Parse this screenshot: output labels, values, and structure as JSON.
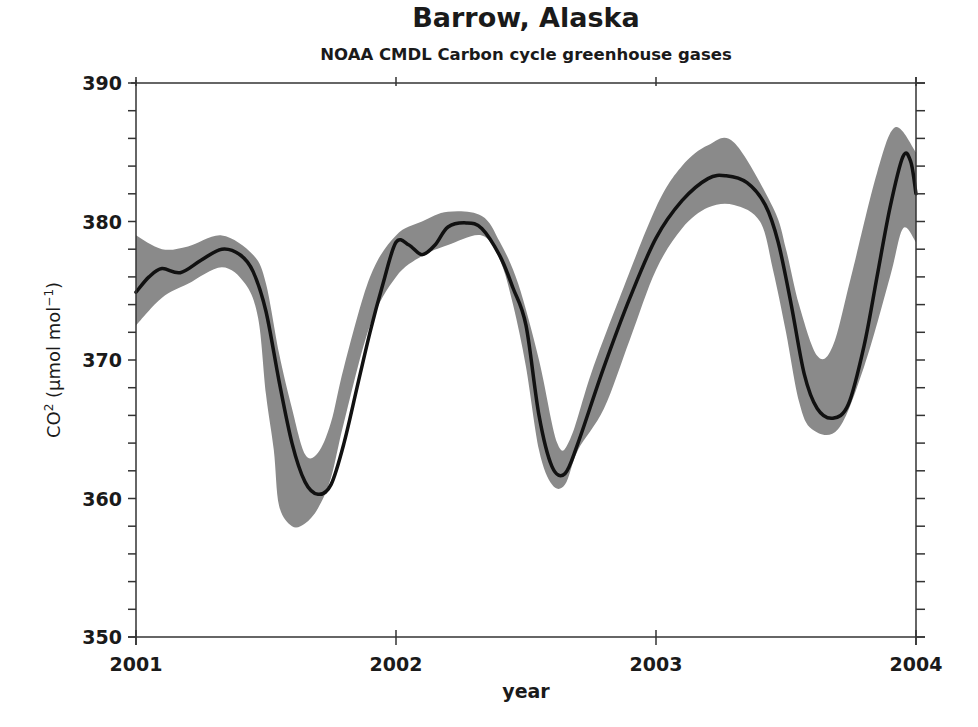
{
  "chart_data": {
    "type": "line",
    "title": "Barrow, Alaska",
    "subtitle": "NOAA CMDL Carbon cycle greenhouse gases",
    "xlabel": "year",
    "ylabel": "CO2 (µmol mol-1)",
    "ylabel_parts": {
      "main": "CO",
      "sup": "2",
      "unit_open": " (µmol mol",
      "unit_sup": "−1",
      "unit_close": ")"
    },
    "xlim": [
      2001,
      2004
    ],
    "ylim": [
      350,
      390
    ],
    "x_ticks": [
      2001,
      2002,
      2003,
      2004
    ],
    "x_tick_labels": [
      "2001",
      "2002",
      "2003",
      "2004"
    ],
    "y_ticks": [
      350,
      360,
      370,
      380,
      390
    ],
    "y_tick_labels": [
      "350",
      "360",
      "370",
      "380",
      "390"
    ],
    "y_minor_step": 2,
    "grid": false,
    "legend": null,
    "colors": {
      "line": "#111111",
      "band": "#8a8a8a",
      "axis": "#333333"
    },
    "series": [
      {
        "name": "CO2 mean",
        "x": [
          2001.0,
          2001.05,
          2001.1,
          2001.17,
          2001.25,
          2001.33,
          2001.4,
          2001.45,
          2001.5,
          2001.55,
          2001.6,
          2001.65,
          2001.7,
          2001.75,
          2001.8,
          2001.85,
          2001.9,
          2001.95,
          2002.0,
          2002.05,
          2002.1,
          2002.15,
          2002.2,
          2002.27,
          2002.33,
          2002.4,
          2002.45,
          2002.5,
          2002.55,
          2002.6,
          2002.65,
          2002.7,
          2002.8,
          2002.9,
          2003.0,
          2003.1,
          2003.2,
          2003.27,
          2003.35,
          2003.42,
          2003.47,
          2003.52,
          2003.57,
          2003.62,
          2003.68,
          2003.74,
          2003.8,
          2003.85,
          2003.9,
          2003.95,
          2003.98,
          2004.0
        ],
        "values": [
          374.9,
          376.0,
          376.6,
          376.3,
          377.2,
          378.0,
          377.6,
          376.4,
          373.5,
          368.5,
          364.0,
          361.2,
          360.3,
          361.0,
          364.0,
          368.0,
          372.0,
          375.5,
          378.5,
          378.3,
          377.6,
          378.3,
          379.6,
          379.9,
          379.5,
          377.5,
          375.2,
          372.5,
          366.0,
          362.3,
          361.8,
          364.0,
          369.5,
          374.5,
          378.8,
          381.5,
          383.1,
          383.3,
          382.8,
          381.2,
          378.5,
          374.0,
          369.0,
          366.5,
          365.8,
          366.8,
          371.0,
          376.0,
          381.0,
          384.7,
          384.3,
          382.0
        ]
      },
      {
        "name": "Uncertainty band upper",
        "x": [
          2001.0,
          2001.1,
          2001.2,
          2001.33,
          2001.45,
          2001.5,
          2001.55,
          2001.6,
          2001.65,
          2001.7,
          2001.75,
          2001.8,
          2001.9,
          2002.0,
          2002.1,
          2002.2,
          2002.33,
          2002.4,
          2002.47,
          2002.55,
          2002.62,
          2002.67,
          2002.75,
          2002.85,
          2003.0,
          2003.1,
          2003.2,
          2003.3,
          2003.45,
          2003.5,
          2003.55,
          2003.62,
          2003.68,
          2003.75,
          2003.85,
          2003.92,
          2004.0
        ],
        "values": [
          379.0,
          378.0,
          378.2,
          379.0,
          377.6,
          375.5,
          370.5,
          366.5,
          363.2,
          363.3,
          365.5,
          369.5,
          376.0,
          379.0,
          380.0,
          380.7,
          380.4,
          378.5,
          375.5,
          370.0,
          364.0,
          364.3,
          369.0,
          374.0,
          381.0,
          384.0,
          385.5,
          385.7,
          381.0,
          378.0,
          374.0,
          370.3,
          371.0,
          376.0,
          383.5,
          386.8,
          385.0
        ]
      },
      {
        "name": "Uncertainty band lower",
        "x": [
          2001.0,
          2001.1,
          2001.2,
          2001.33,
          2001.42,
          2001.47,
          2001.5,
          2001.53,
          2001.55,
          2001.6,
          2001.65,
          2001.7,
          2001.75,
          2001.8,
          2001.9,
          2002.0,
          2002.1,
          2002.2,
          2002.33,
          2002.4,
          2002.45,
          2002.5,
          2002.55,
          2002.6,
          2002.65,
          2002.7,
          2002.8,
          2002.9,
          2003.0,
          2003.1,
          2003.2,
          2003.3,
          2003.4,
          2003.45,
          2003.5,
          2003.55,
          2003.6,
          2003.7,
          2003.8,
          2003.9,
          2003.95,
          2004.0
        ],
        "values": [
          372.5,
          374.5,
          375.5,
          376.7,
          375.5,
          373.0,
          367.5,
          363.5,
          359.5,
          358.0,
          358.2,
          359.3,
          361.5,
          365.5,
          372.5,
          376.0,
          377.5,
          378.3,
          379.0,
          377.2,
          374.0,
          369.5,
          363.5,
          361.0,
          361.0,
          363.5,
          366.5,
          371.5,
          376.5,
          379.5,
          381.0,
          381.2,
          380.0,
          376.5,
          372.0,
          367.0,
          365.0,
          365.0,
          369.5,
          376.0,
          379.5,
          378.5
        ]
      }
    ]
  }
}
